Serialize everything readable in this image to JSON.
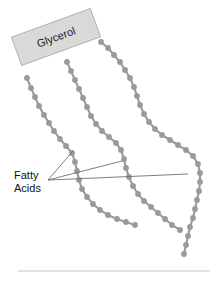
{
  "figure": {
    "width": 214,
    "height": 284,
    "background_color": "#ffffff"
  },
  "labels": {
    "glycerol": "Glycerol",
    "fatty_acids_line1": "Fatty",
    "fatty_acids_line2": "Acids"
  },
  "colors": {
    "glycerol_box_fill": "#d9d9d9",
    "glycerol_box_stroke": "#a8a8a8",
    "chain_dot": "#9a9a9a",
    "leader_line": "#6f6f6f",
    "baseline_rule": "#c4c4c4",
    "text": "#111111"
  },
  "glycerol_box": {
    "x": 14,
    "y": 22,
    "width": 84,
    "height": 30,
    "rotation_deg": -20
  },
  "fatty_acid_chains": [
    {
      "name": "chain-left",
      "points": [
        [
          27,
          78
        ],
        [
          31,
          88
        ],
        [
          35,
          97
        ],
        [
          39,
          106
        ],
        [
          44,
          115
        ],
        [
          49,
          123
        ],
        [
          54,
          131
        ],
        [
          60,
          139
        ],
        [
          66,
          146
        ],
        [
          72,
          153
        ],
        [
          75,
          162
        ],
        [
          77,
          171
        ],
        [
          79,
          180
        ],
        [
          82,
          189
        ],
        [
          87,
          197
        ],
        [
          93,
          204
        ],
        [
          100,
          210
        ],
        [
          108,
          215
        ],
        [
          117,
          219
        ],
        [
          126,
          222
        ],
        [
          135,
          225
        ]
      ]
    },
    {
      "name": "chain-middle",
      "points": [
        [
          67,
          62
        ],
        [
          71,
          71
        ],
        [
          75,
          80
        ],
        [
          79,
          89
        ],
        [
          83,
          98
        ],
        [
          87,
          107
        ],
        [
          91,
          116
        ],
        [
          96,
          124
        ],
        [
          102,
          131
        ],
        [
          109,
          137
        ],
        [
          116,
          143
        ],
        [
          121,
          150
        ],
        [
          124,
          159
        ],
        [
          126,
          168
        ],
        [
          129,
          177
        ],
        [
          133,
          186
        ],
        [
          138,
          194
        ],
        [
          144,
          201
        ],
        [
          151,
          207
        ],
        [
          158,
          213
        ],
        [
          165,
          219
        ],
        [
          172,
          225
        ],
        [
          180,
          230
        ]
      ]
    },
    {
      "name": "chain-right",
      "points": [
        [
          101,
          42
        ],
        [
          108,
          48
        ],
        [
          114,
          55
        ],
        [
          120,
          62
        ],
        [
          125,
          70
        ],
        [
          130,
          78
        ],
        [
          134,
          87
        ],
        [
          137,
          96
        ],
        [
          140,
          105
        ],
        [
          144,
          114
        ],
        [
          149,
          122
        ],
        [
          155,
          129
        ],
        [
          162,
          135
        ],
        [
          170,
          140
        ],
        [
          178,
          145
        ],
        [
          186,
          150
        ],
        [
          193,
          156
        ],
        [
          198,
          164
        ],
        [
          200,
          173
        ],
        [
          200,
          182
        ],
        [
          199,
          191
        ],
        [
          197,
          200
        ],
        [
          195,
          209
        ],
        [
          193,
          218
        ],
        [
          190,
          227
        ],
        [
          188,
          236
        ],
        [
          186,
          245
        ],
        [
          184,
          254
        ]
      ]
    }
  ],
  "leader_lines": [
    {
      "name": "leader-to-chain-left-upper",
      "x1": 48,
      "y1": 180,
      "x2": 73,
      "y2": 151
    },
    {
      "name": "leader-to-chain-middle",
      "x1": 48,
      "y1": 180,
      "x2": 122,
      "y2": 161
    },
    {
      "name": "leader-to-chain-right",
      "x1": 48,
      "y1": 180,
      "x2": 188,
      "y2": 174
    }
  ],
  "baseline_rule": {
    "x1": 18,
    "y1": 271,
    "x2": 210,
    "y2": 271
  },
  "fatty_acids_label_position": {
    "x": 14,
    "y": 179
  }
}
